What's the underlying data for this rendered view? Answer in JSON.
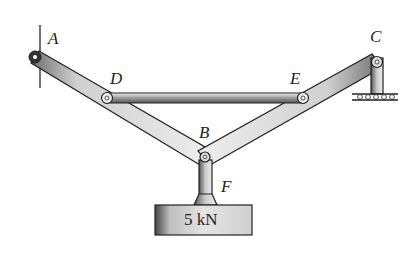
{
  "diagram": {
    "type": "statics-frame",
    "labels": {
      "A": "A",
      "B": "B",
      "C": "C",
      "D": "D",
      "E": "E",
      "F": "F"
    },
    "load": {
      "label": "5 kN",
      "value": 5,
      "unit": "kN"
    },
    "members": [
      "A-B",
      "C-B",
      "D-E",
      "B-F"
    ],
    "supports": {
      "A": "pin-wall",
      "C": "roller-post"
    },
    "colors": {
      "stroke": "#222222",
      "fill_light": "#e6e6e6",
      "fill_dark": "#8a8a8a",
      "background": "#ffffff"
    }
  }
}
